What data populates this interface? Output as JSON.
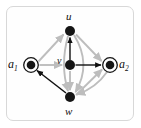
{
  "figure": {
    "kind": "directed-graph-diagram",
    "frame": {
      "border_color": "#d8d8d8",
      "background_color": "#fefefe",
      "corner_radius": "7px"
    },
    "colors": {
      "node_fill": "#151515",
      "node_ring": "#151515",
      "edge_black": "#111111",
      "edge_gray": "#bdbdbd",
      "label_color": "#101010"
    },
    "nodes": [
      {
        "id": "u",
        "label": "u",
        "label_position": "above",
        "shape": "filled-disc",
        "x": 70,
        "y": 31,
        "radius": 5
      },
      {
        "id": "v",
        "label": "v",
        "label_position": "upper-left",
        "shape": "filled-disc",
        "x": 70,
        "y": 65,
        "radius": 5
      },
      {
        "id": "w",
        "label": "w",
        "label_position": "below",
        "shape": "filled-disc",
        "x": 70,
        "y": 97,
        "radius": 5
      },
      {
        "id": "a1",
        "label": "a",
        "subscript": "1",
        "label_position": "left",
        "shape": "ringed-disc",
        "x": 31,
        "y": 65,
        "radius": 4.5,
        "ring_radius": 7.5
      },
      {
        "id": "a2",
        "label": "a",
        "subscript": "2",
        "label_position": "right",
        "shape": "ringed-disc",
        "x": 110,
        "y": 65,
        "radius": 4.5,
        "ring_radius": 7.5
      }
    ],
    "edges": [
      {
        "id": "e-v-u",
        "from": "v",
        "to": "u",
        "color": "#111111",
        "style": "straight",
        "arrow": true
      },
      {
        "id": "e-v-a2",
        "from": "v",
        "to": "a2",
        "color": "#111111",
        "style": "straight",
        "arrow": true
      },
      {
        "id": "e-w-a1",
        "from": "w",
        "to": "a1",
        "color": "#111111",
        "style": "straight",
        "arrow": true
      },
      {
        "id": "e-a1-u",
        "from": "a1",
        "to": "u",
        "color": "#bdbdbd",
        "style": "straight",
        "arrow": true
      },
      {
        "id": "e-a1-v",
        "from": "a1",
        "to": "v",
        "color": "#bdbdbd",
        "style": "straight",
        "arrow": true
      },
      {
        "id": "e-u-a2",
        "from": "u",
        "to": "a2",
        "color": "#bdbdbd",
        "style": "straight",
        "arrow": true
      },
      {
        "id": "e-v-w",
        "from": "v",
        "to": "w",
        "color": "#bdbdbd",
        "style": "straight",
        "arrow": true
      },
      {
        "id": "e-w-a2",
        "from": "w",
        "to": "a2",
        "color": "#bdbdbd",
        "style": "straight",
        "arrow": true
      },
      {
        "id": "e-u-w-right",
        "from": "u",
        "to": "w",
        "color": "#bdbdbd",
        "style": "curve-right",
        "arrow": true
      },
      {
        "id": "e-u-w-left",
        "from": "u",
        "to": "w",
        "color": "#bdbdbd",
        "style": "curve-left",
        "arrow": true
      },
      {
        "id": "e-a2-w",
        "from": "a2",
        "to": "w",
        "color": "#bdbdbd",
        "style": "curve",
        "arrow": true
      }
    ]
  }
}
